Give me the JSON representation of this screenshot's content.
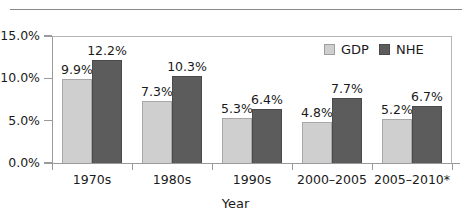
{
  "chart_data": {
    "type": "bar",
    "title": "",
    "xlabel": "Year",
    "ylabel": "",
    "categories": [
      "1970s",
      "1980s",
      "1990s",
      "2000–2005",
      "2005–2010*"
    ],
    "series": [
      {
        "name": "GDP",
        "values": [
          9.9,
          7.3,
          5.3,
          4.8,
          5.2
        ],
        "color": "#cfcfcf"
      },
      {
        "name": "NHE",
        "values": [
          12.2,
          10.3,
          6.4,
          7.7,
          6.7
        ],
        "color": "#5c5c5c"
      }
    ],
    "data_labels": [
      [
        "9.9%",
        "12.2%"
      ],
      [
        "7.3%",
        "10.3%"
      ],
      [
        "5.3%",
        "6.4%"
      ],
      [
        "4.8%",
        "7.7%"
      ],
      [
        "5.2%",
        "6.7%"
      ]
    ],
    "ylim": [
      0,
      15
    ],
    "ytick_values": [
      0,
      5,
      10,
      15
    ],
    "ytick_labels": [
      "0.0%",
      "5.0%",
      "10.0%",
      "15.0%"
    ],
    "grid": false,
    "legend_position": "top-right",
    "legend_entries": [
      "GDP",
      "NHE"
    ]
  },
  "axes": {
    "x_title": "Year"
  }
}
